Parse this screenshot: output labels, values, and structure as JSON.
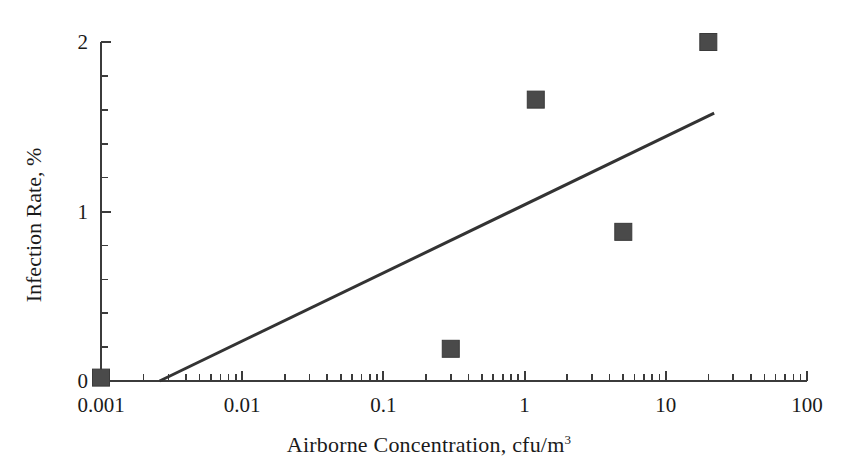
{
  "chart_data": {
    "type": "scatter",
    "title": "",
    "xlabel": "Airborne Concentration, cfu/m",
    "xlabel_sup": "3",
    "ylabel": "Infection Rate, %",
    "xscale": "log",
    "yscale": "linear",
    "xlim": [
      0.001,
      100
    ],
    "ylim": [
      0,
      2
    ],
    "grid": false,
    "legend": null,
    "x_tick_labels": [
      "0.001",
      "0.01",
      "0.1",
      "1",
      "10",
      "100"
    ],
    "x_tick_values": [
      0.001,
      0.01,
      0.1,
      1,
      10,
      100
    ],
    "y_tick_labels": [
      "0",
      "1",
      "2"
    ],
    "y_tick_values": [
      0,
      1,
      2
    ],
    "y_minor_step": 0.2,
    "marker_shape": "square",
    "marker_color": "#4a4a4a",
    "points": [
      {
        "x": 0.001,
        "y": 0.02
      },
      {
        "x": 0.3,
        "y": 0.19
      },
      {
        "x": 1.2,
        "y": 1.66
      },
      {
        "x": 5.0,
        "y": 0.88
      },
      {
        "x": 20.0,
        "y": 2.0
      }
    ],
    "trend_line": {
      "color": "#333333",
      "x_start": 0.0026,
      "y_start": 0.0,
      "x_end": 22.0,
      "y_end": 1.58
    }
  }
}
